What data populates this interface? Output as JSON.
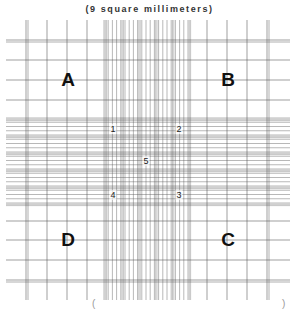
{
  "caption": "(9 square millimeters)",
  "bottom_fragments": {
    "left": "(",
    "right": ")"
  },
  "corner_squares": [
    {
      "label": "A",
      "x": 68,
      "y": 80
    },
    {
      "label": "B",
      "x": 228,
      "y": 80
    },
    {
      "label": "D",
      "x": 68,
      "y": 240
    },
    {
      "label": "C",
      "x": 228,
      "y": 240
    }
  ],
  "center_points": [
    {
      "label": "1",
      "x": 113,
      "y": 129
    },
    {
      "label": "2",
      "x": 179,
      "y": 129
    },
    {
      "label": "5",
      "x": 146,
      "y": 161
    },
    {
      "label": "4",
      "x": 113,
      "y": 195
    },
    {
      "label": "3",
      "x": 179,
      "y": 195
    }
  ],
  "grid": {
    "line_color": "#555555",
    "outer_extent": {
      "x1": 6,
      "x2": 290,
      "y1": 20,
      "y2": 300
    },
    "outer_verticals": [
      26,
      47,
      67,
      87,
      207,
      227,
      247,
      267
    ],
    "double_verticals": [
      26,
      267
    ],
    "outer_horizontals": [
      40,
      60,
      80,
      100,
      221,
      240,
      260,
      280
    ],
    "double_horizontals": [
      40,
      280
    ],
    "center_band": {
      "x1": 104,
      "x2": 188,
      "y1": 118,
      "y2": 203,
      "divisions": 20,
      "triple_every": 4
    }
  }
}
